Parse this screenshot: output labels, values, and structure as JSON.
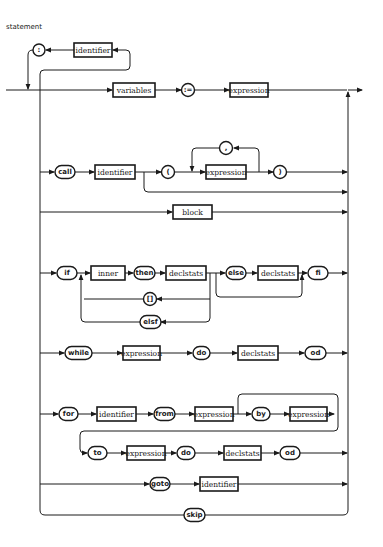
{
  "diagram": {
    "title": "statement",
    "type": "syntax-railroad-diagram",
    "prefix_loop": {
      "nonterminal": "identifier",
      "terminal": ":"
    },
    "rows": [
      {
        "name": "assignment",
        "items": [
          {
            "kind": "nonterminal",
            "label": "variables"
          },
          {
            "kind": "terminal",
            "label": ":="
          },
          {
            "kind": "nonterminal",
            "label": "expression"
          }
        ]
      },
      {
        "name": "call",
        "items": [
          {
            "kind": "terminal",
            "label": "call"
          },
          {
            "kind": "nonterminal",
            "label": "identifier"
          },
          {
            "kind": "terminal",
            "label": "("
          },
          {
            "kind": "nonterminal",
            "label": "expression"
          },
          {
            "kind": "terminal",
            "label": ","
          },
          {
            "kind": "terminal",
            "label": ")"
          }
        ]
      },
      {
        "name": "block",
        "items": [
          {
            "kind": "nonterminal",
            "label": "block"
          }
        ]
      },
      {
        "name": "if",
        "items": [
          {
            "kind": "terminal",
            "label": "if"
          },
          {
            "kind": "nonterminal",
            "label": "inner"
          },
          {
            "kind": "terminal",
            "label": "then"
          },
          {
            "kind": "nonterminal",
            "label": "declstats"
          },
          {
            "kind": "terminal",
            "label": "else"
          },
          {
            "kind": "nonterminal",
            "label": "declstats"
          },
          {
            "kind": "terminal",
            "label": "fi"
          },
          {
            "kind": "terminal",
            "label": "[]"
          },
          {
            "kind": "terminal",
            "label": "elsf"
          }
        ]
      },
      {
        "name": "while",
        "items": [
          {
            "kind": "terminal",
            "label": "while"
          },
          {
            "kind": "nonterminal",
            "label": "expression"
          },
          {
            "kind": "terminal",
            "label": "do"
          },
          {
            "kind": "nonterminal",
            "label": "declstats"
          },
          {
            "kind": "terminal",
            "label": "od"
          }
        ]
      },
      {
        "name": "for",
        "items": [
          {
            "kind": "terminal",
            "label": "for"
          },
          {
            "kind": "nonterminal",
            "label": "identifier"
          },
          {
            "kind": "terminal",
            "label": "from"
          },
          {
            "kind": "nonterminal",
            "label": "expression"
          },
          {
            "kind": "terminal",
            "label": "by"
          },
          {
            "kind": "nonterminal",
            "label": "expression"
          },
          {
            "kind": "terminal",
            "label": "to"
          },
          {
            "kind": "nonterminal",
            "label": "expression"
          },
          {
            "kind": "terminal",
            "label": "do"
          },
          {
            "kind": "nonterminal",
            "label": "declstats"
          },
          {
            "kind": "terminal",
            "label": "od"
          }
        ]
      },
      {
        "name": "goto",
        "items": [
          {
            "kind": "terminal",
            "label": "goto"
          },
          {
            "kind": "nonterminal",
            "label": "identifier"
          }
        ]
      },
      {
        "name": "skip",
        "items": [
          {
            "kind": "terminal",
            "label": "skip"
          }
        ]
      }
    ]
  }
}
